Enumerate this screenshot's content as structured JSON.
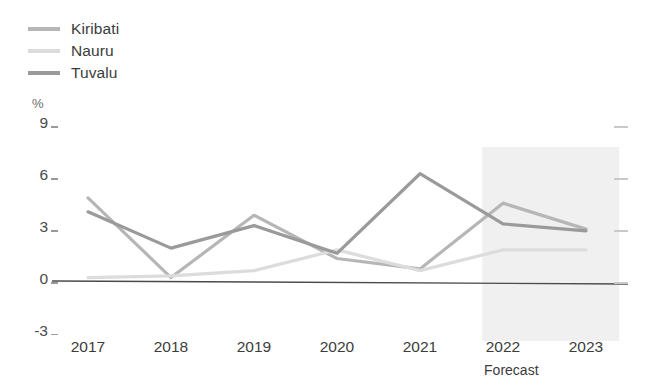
{
  "chart_data": {
    "type": "line",
    "title": "",
    "subtitle": "",
    "xlabel": "",
    "ylabel": "%",
    "unit": "%",
    "x": [
      "2017",
      "2018",
      "2019",
      "2020",
      "2021",
      "2022",
      "2023"
    ],
    "categories": [
      "2017",
      "2018",
      "2019",
      "2020",
      "2021",
      "2022",
      "2023"
    ],
    "ylim": [
      -3,
      9
    ],
    "yticks": [
      9,
      6,
      3,
      0,
      -3
    ],
    "ytick_labels": [
      "9",
      "6",
      "3",
      "0",
      "-3"
    ],
    "grid": false,
    "legend_position": "top-left",
    "zero_line": true,
    "series": [
      {
        "name": "Kiribati",
        "color": "#b6b6b6",
        "values": [
          4.8,
          0.2,
          3.8,
          1.3,
          0.7,
          4.5,
          3.0
        ]
      },
      {
        "name": "Nauru",
        "color": "#dcdcdc",
        "values": [
          0.2,
          0.3,
          0.6,
          1.8,
          0.6,
          1.8,
          1.8
        ]
      },
      {
        "name": "Tuvalu",
        "color": "#9a9a9a",
        "values": [
          4.0,
          1.9,
          3.2,
          1.6,
          6.2,
          3.3,
          2.9
        ]
      }
    ],
    "annotations": [
      {
        "name": "forecast-band",
        "label": "Forecast",
        "x_start": "2021.75",
        "x_end": "2023.4",
        "color": "#f0f0f0"
      }
    ]
  },
  "legend": {
    "items": [
      {
        "label": "Kiribati",
        "color": "#b6b6b6"
      },
      {
        "label": "Nauru",
        "color": "#dcdcdc"
      },
      {
        "label": "Tuvalu",
        "color": "#9a9a9a"
      }
    ]
  },
  "axes": {
    "unit": "%",
    "y_labels": [
      "9",
      "6",
      "3",
      "0",
      "-3"
    ],
    "x_labels": [
      "2017",
      "2018",
      "2019",
      "2020",
      "2021",
      "2022",
      "2023"
    ],
    "forecast_caption": "Forecast"
  }
}
